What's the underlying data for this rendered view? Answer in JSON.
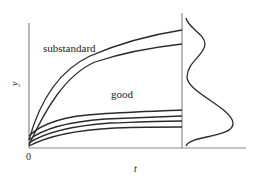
{
  "figure": {
    "labels": {
      "y_axis": "y",
      "x_axis": "t",
      "origin": "0",
      "upper_group": "substandard",
      "lower_group": "good"
    },
    "colors": {
      "axis": "#8a8a8a",
      "curve": "#2a2a2a",
      "text": "#222222",
      "background": "#ffffff"
    },
    "groups": [
      {
        "name": "substandard",
        "curve_count": 2,
        "end_y_px": [
          30,
          44
        ]
      },
      {
        "name": "good",
        "curve_count": 4,
        "end_y_px": [
          111,
          117,
          121,
          127
        ]
      }
    ],
    "side_density": {
      "description": "bimodal distribution of y at final t",
      "modes": [
        "small mode near substandard",
        "large mode near good"
      ]
    }
  }
}
